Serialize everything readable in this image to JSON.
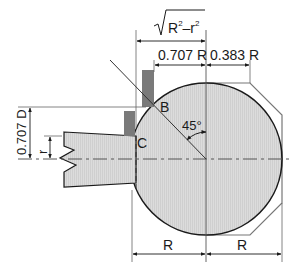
{
  "diagram": {
    "type": "technical-drawing",
    "colors": {
      "line": "#1a1a1a",
      "thin_line": "#555555",
      "fill": "#d9d9d9",
      "tool_fill": "#e2e2e2",
      "dark_block": "#7a7a7a",
      "octagon": "#666666"
    },
    "labels": {
      "sqrt_expr_radicand": "R",
      "sqrt_expr_sup1": "2",
      "sqrt_expr_minus": "–r",
      "sqrt_expr_sup2": "2",
      "dim_0707R": "0.707 R",
      "dim_0383R": "0.383 R",
      "dim_0707D": "0.707 D",
      "dim_r": "r",
      "point_B": "B",
      "point_C": "C",
      "angle": "45°",
      "dim_R_left": "R",
      "dim_R_right": "R"
    }
  }
}
